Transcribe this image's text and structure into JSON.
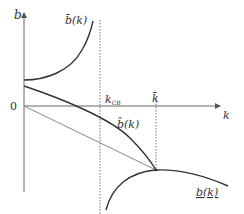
{
  "diagram": {
    "axes": {
      "y_label": "b",
      "x_label": "k",
      "origin_label": "0"
    },
    "markers": {
      "k_cb_label": "k",
      "k_cb_subscript": "CB",
      "k_bar_label": "k̄"
    },
    "curves": {
      "upper_bound": {
        "label": "b̄(k)",
        "name": "b-bar"
      },
      "optimal": {
        "label": "b̂(k)",
        "name": "b-hat"
      },
      "lower_bound": {
        "label": "b(k)",
        "name": "b-underline"
      }
    },
    "colors": {
      "axis": "#555555",
      "curve": "#333333",
      "line": "#888888",
      "dotted": "#888888"
    }
  }
}
